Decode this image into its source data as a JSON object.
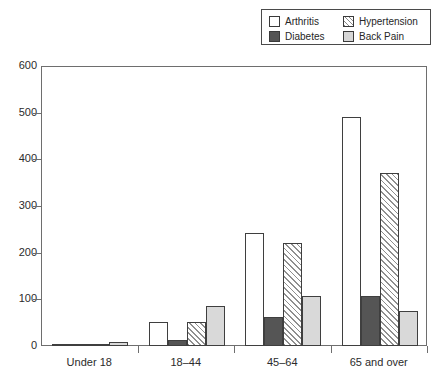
{
  "legend": {
    "position": "top-right",
    "entries": [
      {
        "label": "Arthritis",
        "icon": "swatch-white-square",
        "swatch_class": "sw-arthritis",
        "color": "#ffffff"
      },
      {
        "label": "Hypertension",
        "icon": "swatch-hatched-square",
        "swatch_class": "sw-hypertension",
        "color": "#8a8a8a"
      },
      {
        "label": "Diabetes",
        "icon": "swatch-dark-square",
        "swatch_class": "sw-diabetes",
        "color": "#555555"
      },
      {
        "label": "Back Pain",
        "icon": "swatch-grey-square",
        "swatch_class": "sw-backpain",
        "color": "#d6d6d6"
      }
    ]
  },
  "axes": {
    "y_ticks": [
      "600",
      "500",
      "400",
      "300",
      "200",
      "100",
      "0"
    ],
    "x_ticks": [
      "Under 18",
      "18–44",
      "45–64",
      "65 and over"
    ]
  },
  "chart_data": {
    "type": "bar",
    "title": "",
    "subtitle": "",
    "xlabel": "",
    "ylabel": "",
    "ylim": [
      0,
      600
    ],
    "ytick_step": 100,
    "grid": false,
    "legend_position": "top-right",
    "categories": [
      "Under 18",
      "18–44",
      "45–64",
      "65 and over"
    ],
    "series": [
      {
        "name": "Arthritis",
        "values": [
          2,
          52,
          242,
          490
        ]
      },
      {
        "name": "Diabetes",
        "values": [
          1,
          13,
          62,
          107
        ]
      },
      {
        "name": "Hypertension",
        "values": [
          1,
          52,
          221,
          371
        ]
      },
      {
        "name": "Back Pain",
        "values": [
          8,
          85,
          108,
          75
        ]
      }
    ]
  }
}
